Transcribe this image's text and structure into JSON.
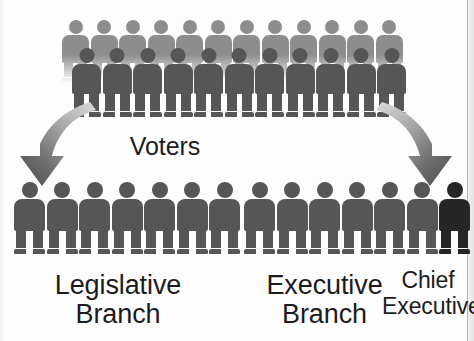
{
  "diagram": {
    "background_color": "#fdfdfd"
  },
  "colors": {
    "figure_back_row": "#8d8d8d",
    "figure_front_row": "#565656",
    "figure_branch": "#565656",
    "figure_chief_executive": "#262626",
    "arrow_light": "#d2d2d2",
    "arrow_dark": "#5d5d5d",
    "text": "#1c1c1c",
    "page_rule": "#b8b8b8"
  },
  "voters": {
    "label": "Voters",
    "back_row_count": 12,
    "front_row_count": 11
  },
  "arrows": [
    {
      "name": "arrow-to-legislative",
      "direction": "down-left"
    },
    {
      "name": "arrow-to-executive",
      "direction": "down-right"
    }
  ],
  "legislative": {
    "label": "Legislative\nBranch",
    "count": 7
  },
  "executive": {
    "label": "Executive\nBranch",
    "count": 6
  },
  "chief_executive": {
    "label": "Chief\nExecutive",
    "count": 1
  }
}
